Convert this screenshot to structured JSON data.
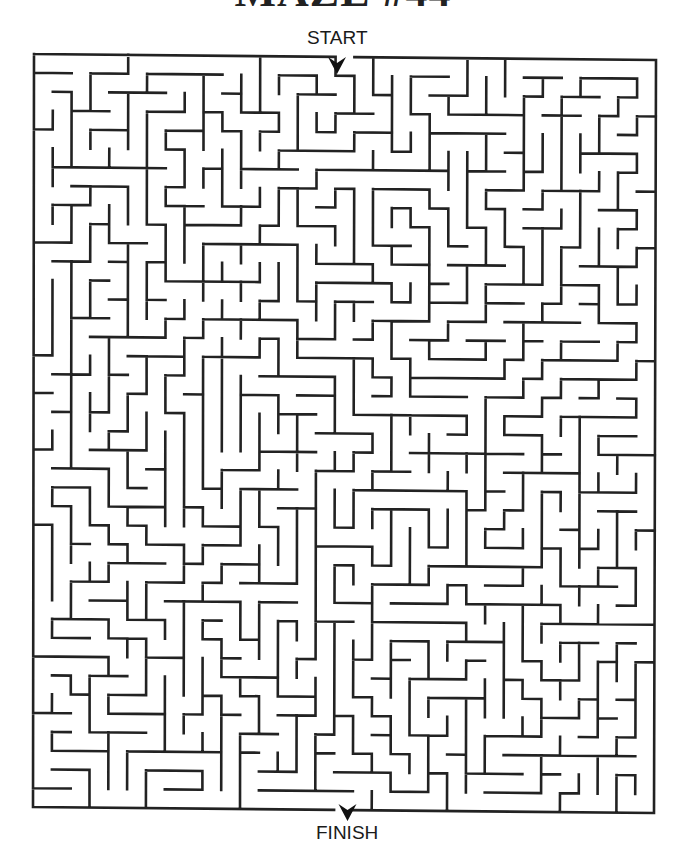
{
  "title": "MAZE #44",
  "labels": {
    "start": "START",
    "finish": "FINISH"
  },
  "maze": {
    "cols": 33,
    "rows": 40,
    "seed": 44,
    "frame": {
      "top_left": [
        34,
        54
      ],
      "top_right": [
        656,
        60
      ],
      "bottom_left": [
        33,
        807
      ],
      "bottom_right": [
        654,
        813
      ]
    },
    "start_col": 16,
    "finish_col": 16,
    "wall_color": "#222222",
    "wall_width": 2.6,
    "arrow_color": "#111111"
  }
}
